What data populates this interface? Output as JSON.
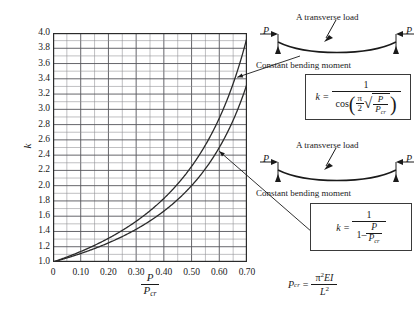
{
  "chart_data": {
    "type": "line",
    "title": "",
    "xlabel": "P / P_cr",
    "ylabel": "k",
    "xlim": [
      0,
      0.7
    ],
    "ylim": [
      1.0,
      4.0
    ],
    "grid": true,
    "x_ticks": [
      "0",
      "0.10",
      "0.20",
      "0.30",
      "0.40",
      "0.50",
      "0.60",
      "0.70"
    ],
    "x_tick_values": [
      0,
      0.1,
      0.2,
      0.3,
      0.4,
      0.5,
      0.6,
      0.7
    ],
    "x_minor_step": 0.05,
    "y_ticks": [
      "1.0",
      "1.2",
      "1.4",
      "1.6",
      "1.8",
      "2.0",
      "2.2",
      "2.4",
      "2.6",
      "2.8",
      "3.0",
      "3.2",
      "3.4",
      "3.6",
      "3.8",
      "4.0"
    ],
    "y_tick_values": [
      1.0,
      1.2,
      1.4,
      1.6,
      1.8,
      2.0,
      2.2,
      2.4,
      2.6,
      2.8,
      3.0,
      3.2,
      3.4,
      3.6,
      3.8,
      4.0
    ],
    "y_minor_step": 0.1,
    "legend_position": "none",
    "series": [
      {
        "name": "k = 1 / cos((pi/2)*sqrt(P/Pcr))",
        "formula": "secant",
        "x": [
          0,
          0.05,
          0.1,
          0.15,
          0.2,
          0.25,
          0.3,
          0.35,
          0.4,
          0.45,
          0.5,
          0.55,
          0.6,
          0.65,
          0.7
        ],
        "values": [
          1.0,
          1.063,
          1.131,
          1.206,
          1.289,
          1.382,
          1.488,
          1.61,
          1.753,
          1.925,
          2.136,
          2.405,
          2.762,
          3.268,
          4.052
        ]
      },
      {
        "name": "k = 1 / (1 - P/Pcr)",
        "formula": "amplification",
        "x": [
          0,
          0.05,
          0.1,
          0.15,
          0.2,
          0.25,
          0.3,
          0.35,
          0.4,
          0.45,
          0.5,
          0.55,
          0.6,
          0.65,
          0.7
        ],
        "values": [
          1.0,
          1.053,
          1.111,
          1.176,
          1.25,
          1.333,
          1.429,
          1.538,
          1.667,
          1.818,
          2.0,
          2.222,
          2.5,
          2.857,
          3.333
        ]
      }
    ],
    "annotations": [
      {
        "label": "upper curve callout",
        "x": 0.665,
        "y": 3.42
      },
      {
        "label": "lower curve callout",
        "x": 0.6,
        "y": 2.45
      }
    ]
  },
  "axes": {
    "ylabel_symbol": "k",
    "xlabel_num": "P",
    "xlabel_den": "P",
    "xlabel_den_sub": "cr"
  },
  "diagrams": [
    {
      "id": "secant-case",
      "title": "A transverse load",
      "caption": "Constant bending moment",
      "load_left": "P",
      "load_right": "P"
    },
    {
      "id": "amplification-case",
      "title": "A transverse load",
      "caption": "Constant bending moment",
      "load_left": "P",
      "load_right": "P"
    }
  ],
  "formulas": {
    "box1": {
      "lhs": "k",
      "eq": "=",
      "numerator": "1",
      "denom_fn": "cos",
      "denom_pi": "π",
      "denom_two": "2",
      "denom_radicand_num": "P",
      "denom_radicand_den": "P",
      "denom_radicand_sub": "cr"
    },
    "box2": {
      "lhs": "k",
      "eq": "=",
      "numerator": "1",
      "denom_one": "1",
      "denom_minus": "–",
      "denom_frac_num": "P",
      "denom_frac_den": "P",
      "denom_frac_sub": "cr"
    },
    "pcr": {
      "lhs": "P",
      "lhs_sub": "cr",
      "eq": "=",
      "num_pi": "π",
      "num_exp": "2",
      "num_E": "E",
      "num_I": "I",
      "den_L": "L",
      "den_exp": "2"
    }
  },
  "colors": {
    "background": "#ffffff",
    "curve": "#2b2b2b",
    "grid_major": "#55555a",
    "grid_minor": "#8b8b90",
    "frame": "#2b2b2b",
    "text": "#1a1a1a"
  }
}
